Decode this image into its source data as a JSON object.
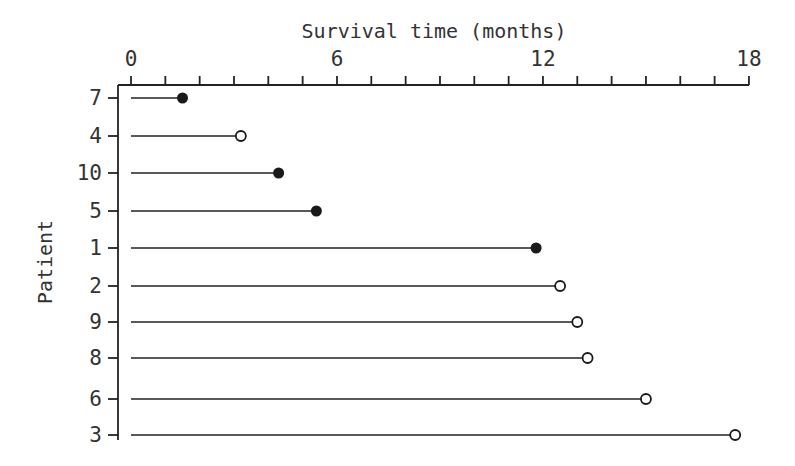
{
  "chart_data": {
    "type": "scatter",
    "subtype": "patient-survival-lollipop",
    "title": "Survival time (months)",
    "xlabel": "Survival time (months)",
    "ylabel": "Patient",
    "xlim": [
      0,
      18
    ],
    "x_ticks_major": [
      0,
      6,
      12,
      18
    ],
    "x_tick_labels": [
      "0",
      "6",
      "12",
      "18"
    ],
    "x_minor_step": 1,
    "x_axis_position": "top",
    "grid": false,
    "legend": null,
    "marker_legend": {
      "filled": "event (death)",
      "open": "censored"
    },
    "patients": [
      {
        "patient": "7",
        "time": 1.5,
        "status": "filled"
      },
      {
        "patient": "4",
        "time": 3.2,
        "status": "open"
      },
      {
        "patient": "10",
        "time": 4.3,
        "status": "filled"
      },
      {
        "patient": "5",
        "time": 5.4,
        "status": "filled"
      },
      {
        "patient": "1",
        "time": 11.8,
        "status": "filled"
      },
      {
        "patient": "2",
        "time": 12.5,
        "status": "open"
      },
      {
        "patient": "9",
        "time": 13.0,
        "status": "open"
      },
      {
        "patient": "8",
        "time": 13.3,
        "status": "open"
      },
      {
        "patient": "6",
        "time": 15.0,
        "status": "open"
      },
      {
        "patient": "3",
        "time": 17.6,
        "status": "open"
      }
    ]
  },
  "layout": {
    "x0_px": 131,
    "px_per_month": 34.33,
    "row_y_px": [
      98,
      136,
      173,
      211,
      248,
      286,
      322,
      358,
      399,
      435
    ],
    "frame_left_px": 118,
    "frame_top_px": 85,
    "frame_bottom_px": 440,
    "frame_right_px": 749
  }
}
